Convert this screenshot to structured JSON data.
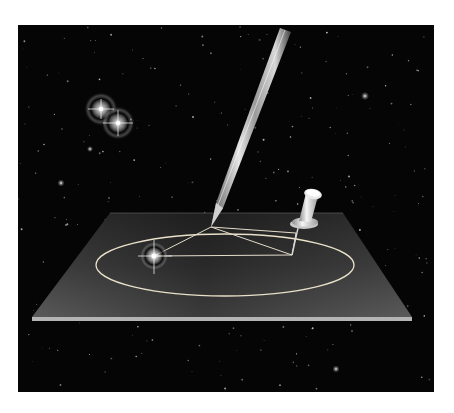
{
  "illustration": {
    "description": "Pen tracing an elliptical orbit around a star, with a pushpin at the second focus, on a board floating in space",
    "colors": {
      "page_background": "#ffffff",
      "space": "#050505",
      "board_light": "#5a5a5a",
      "board_dark": "#2a2a2a",
      "board_edge": "#b4b4b4",
      "orbit_line": "#e8e0c8",
      "star_glow": "#ffffff"
    },
    "frame": {
      "x": 18,
      "y": 25,
      "width": 416,
      "height": 367
    },
    "board": {
      "top_left": [
        110,
        213
      ],
      "top_right": [
        343,
        213
      ],
      "bottom_right": [
        412,
        317
      ],
      "bottom_left": [
        32,
        317
      ],
      "edge_thickness": 4
    },
    "orbit_ellipse": {
      "cx": 225,
      "cy": 265,
      "rx": 129,
      "ry": 31
    },
    "focus_star": {
      "x": 154,
      "y": 256
    },
    "pen_tip": {
      "x": 211,
      "y": 227
    },
    "pin_point": {
      "x": 292,
      "y": 255
    },
    "binary_stars": [
      {
        "x": 101,
        "y": 109
      },
      {
        "x": 118,
        "y": 123
      }
    ],
    "bright_stars": [
      {
        "x": 365,
        "y": 96
      },
      {
        "x": 90,
        "y": 149
      },
      {
        "x": 61,
        "y": 183
      },
      {
        "x": 336,
        "y": 369
      }
    ],
    "icons": {
      "pen": "pen-icon",
      "pushpin": "pushpin-icon",
      "star": "star-icon"
    }
  }
}
